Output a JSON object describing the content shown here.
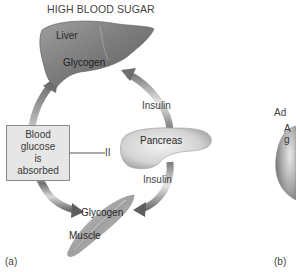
{
  "title": "HIGH BLOOD SUGAR",
  "panels": {
    "a": {
      "label": "(a)",
      "organs": {
        "liver": {
          "name": "Liver",
          "store": "Glycogen"
        },
        "pancreas": {
          "name": "Pancreas"
        },
        "muscle": {
          "name": "Muscle",
          "store": "Glycogen"
        }
      },
      "hormone_labels": {
        "upper": "Insulin",
        "lower": "Insulin"
      },
      "box": {
        "lines": [
          "Blood",
          "glucose",
          "is",
          "absorbed"
        ]
      },
      "inhibitor_symbol": "II"
    },
    "b": {
      "label": "(b)",
      "partial_text": [
        "Ad",
        "A",
        "g"
      ]
    }
  },
  "colors": {
    "background": "#ffffff",
    "arrow": "#9a9a9a",
    "arrow_dark": "#6e6e6e",
    "organ_fill": "#8c8c8c",
    "box_fill": "#e6e6e6",
    "box_border": "#8a8a8a",
    "text": "#3a3a3a"
  }
}
